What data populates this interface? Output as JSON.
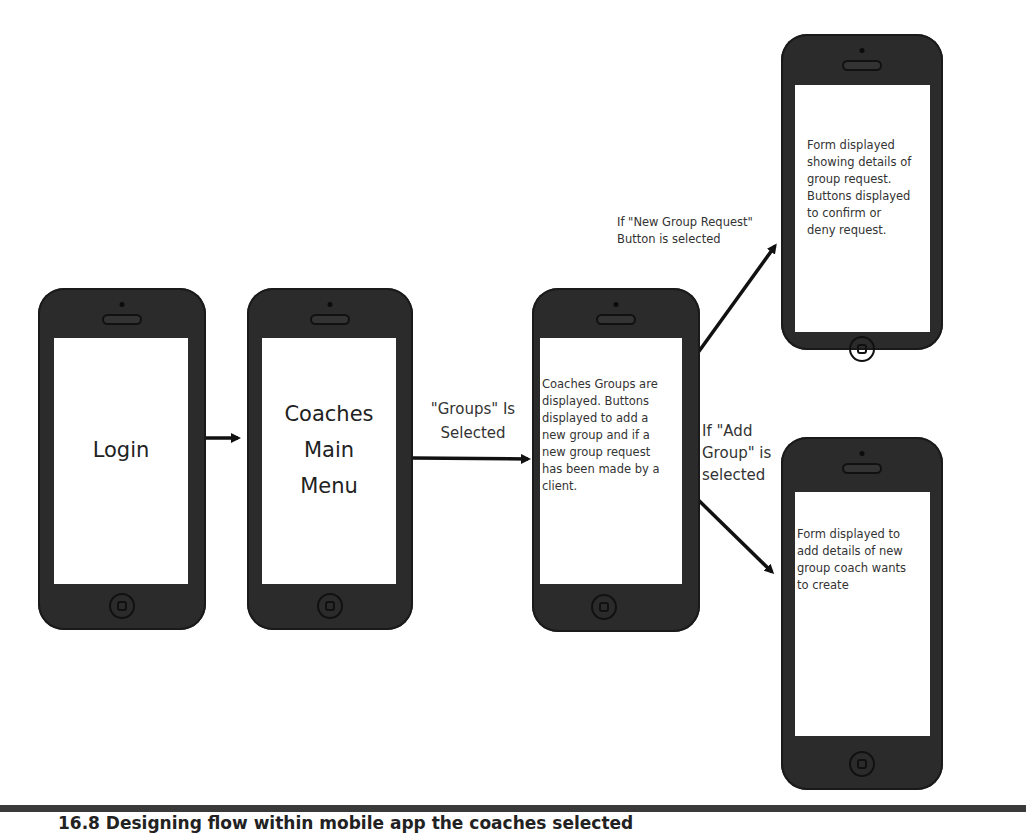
{
  "diagram": {
    "type": "mobile-app-flow",
    "screens": [
      {
        "id": "login",
        "text": "Login"
      },
      {
        "id": "main-menu",
        "text_lines": [
          "Coaches",
          "Main",
          "Menu"
        ]
      },
      {
        "id": "groups",
        "text": "Coaches Groups are\ndisplayed. Buttons\ndisplayed to add a\nnew group and if a\nnew group request\nhas been made by a\nclient."
      },
      {
        "id": "group-request",
        "text": "Form displayed\nshowing details of\ngroup request.\nButtons displayed\nto confirm or\ndeny request."
      },
      {
        "id": "add-group",
        "text": "Form displayed to\nadd details of new\ngroup coach wants\nto create"
      }
    ],
    "transitions": [
      {
        "from": "login",
        "to": "main-menu",
        "label": ""
      },
      {
        "from": "main-menu",
        "to": "groups",
        "label": "\"Groups\" Is\nSelected"
      },
      {
        "from": "groups",
        "to": "group-request",
        "label": "If \"New Group Request\"\nButton is selected"
      },
      {
        "from": "groups",
        "to": "add-group",
        "label": "If \"Add\nGroup\" is\nselected"
      }
    ]
  },
  "caption": "16.8   Designing flow within mobile app the coaches selected"
}
